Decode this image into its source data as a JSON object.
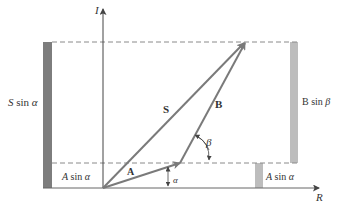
{
  "diagram": {
    "axes": {
      "vertical": {
        "label": "I"
      },
      "horizontal": {
        "label": "R"
      }
    },
    "vectors": [
      {
        "name": "A",
        "label": "A",
        "from": [
          0,
          0
        ],
        "angle_label": "α"
      },
      {
        "name": "B",
        "label": "B",
        "angle_label": "β"
      },
      {
        "name": "S",
        "label": "S"
      }
    ],
    "angle_labels": {
      "alpha": "α",
      "beta": "β"
    },
    "component_labels": {
      "s_sin_alpha_left": "S sin α",
      "a_sin_alpha_left": "A sin α",
      "a_sin_alpha_right": "A sin α",
      "b_sin_beta": "B sin β"
    },
    "colors": {
      "vector": "#7a7a7a",
      "axis": "#555555",
      "dashed": "#8a8a8a",
      "bar_dark": "#7d7d7d",
      "bar_light": "#bdbdbd",
      "text": "#333333"
    }
  }
}
